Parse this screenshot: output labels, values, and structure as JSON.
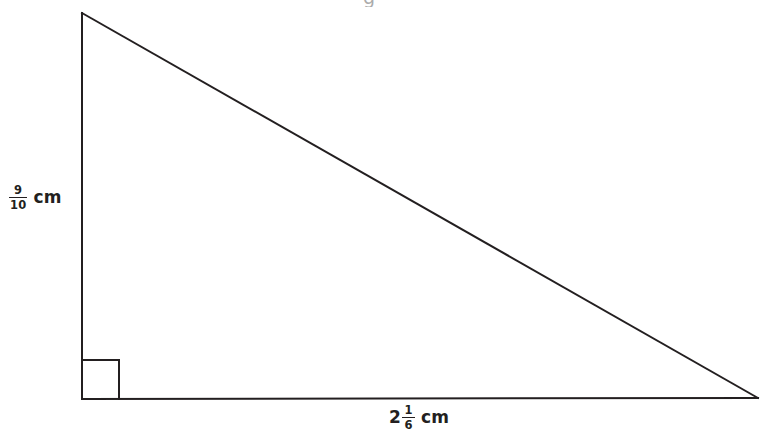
{
  "figure": {
    "name": "right-triangle-with-dimensions",
    "background_color": "#ffffff",
    "stroke_color": "#231f20",
    "stroke_width": 2,
    "vertices": {
      "apex": [
        82,
        13
      ],
      "right_angle_corner": [
        82,
        399
      ],
      "base_right": [
        758,
        398
      ]
    },
    "right_angle_marker": {
      "x": 84,
      "y": 360,
      "width": 35,
      "height": 39,
      "shown": true
    }
  },
  "labels": {
    "height": {
      "whole": "",
      "numerator": "9",
      "denominator": "10",
      "unit": "cm",
      "full_text": "9/10 cm",
      "side": "vertical-left"
    },
    "base": {
      "whole": "2",
      "numerator": "1",
      "denominator": "6",
      "unit": "cm",
      "full_text": "2 1/6 cm",
      "side": "horizontal-bottom"
    }
  },
  "artifacts": {
    "top_cropped_glyph": "g"
  }
}
